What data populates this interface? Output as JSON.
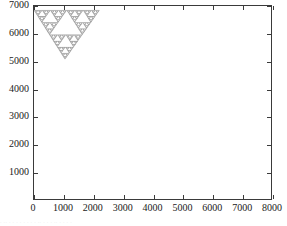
{
  "chart_data": {
    "type": "scatter",
    "title": "",
    "subtitle": "",
    "xlabel": "",
    "ylabel": "",
    "xlim": [
      0,
      8000
    ],
    "ylim": [
      0,
      7000
    ],
    "grid": false,
    "legend": null,
    "marker_color": "#6e6e6e",
    "marker_shape": "point",
    "x_ticks": [
      0,
      1000,
      2000,
      3000,
      4000,
      5000,
      6000,
      7000,
      8000
    ],
    "x_tick_labels": [
      "0",
      "1000",
      "2000",
      "3000",
      "4000",
      "5000",
      "6000",
      "7000",
      "8000"
    ],
    "y_ticks": [
      1000,
      2000,
      3000,
      4000,
      5000,
      6000,
      7000
    ],
    "y_tick_labels": [
      "1000",
      "2000",
      "3000",
      "4000",
      "5000",
      "6000",
      "7000"
    ],
    "fractal": {
      "name": "sierpinski-triangle",
      "orientation": "downward",
      "recursion_depth": 6,
      "vertices": [
        {
          "label": "top-left",
          "x": 0,
          "y": 6450
        },
        {
          "label": "top-right",
          "x": 7400,
          "y": 6450
        },
        {
          "label": "apex",
          "x": 3500,
          "y": 60
        }
      ]
    }
  },
  "axes": {
    "frame_color": "#3a3a3a",
    "tick_direction": "inward",
    "background": "#ffffff"
  },
  "page_bleed": {
    "text": "                    .   .. . .  .  .  . . . .  ..   .     .   . ..      .     .  .   ."
  }
}
